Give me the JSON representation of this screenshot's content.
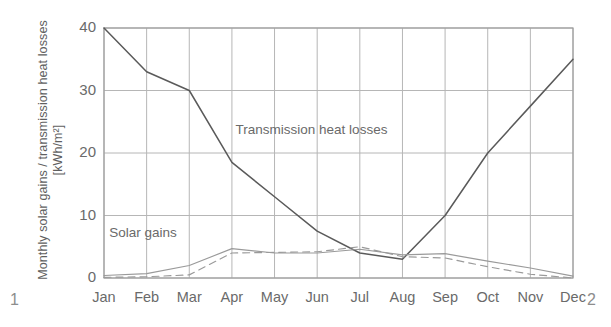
{
  "figure": {
    "corner_label_left": "1",
    "corner_label_right": "2"
  },
  "chart_data": {
    "type": "line",
    "title": "",
    "xlabel": "",
    "ylabel": "Monthly solar gains / transmission heat losses [kWh/m²]",
    "categories": [
      "Jan",
      "Feb",
      "Mar",
      "Apr",
      "May",
      "Jun",
      "Jul",
      "Aug",
      "Sep",
      "Oct",
      "Nov",
      "Dec"
    ],
    "ylim": [
      0,
      40
    ],
    "yticks": [
      0,
      10,
      20,
      30,
      40
    ],
    "ytick_labels": [
      "0",
      "10",
      "20",
      "30",
      "40"
    ],
    "grid": true,
    "legend": "inline-annotations",
    "annotations": [
      {
        "text": "Transmission heat losses",
        "x_month": "Jun",
        "y_value": 23.5
      },
      {
        "text": "Solar gains",
        "x_month": "Feb",
        "y_value": 7.0
      }
    ],
    "series": [
      {
        "name": "Transmission heat losses",
        "style": "solid",
        "color": "#5a5a5a",
        "values": [
          40.0,
          33.0,
          30.0,
          18.5,
          13.0,
          7.5,
          4.0,
          3.0,
          10.0,
          20.0,
          27.5,
          35.0
        ]
      },
      {
        "name": "Solar gains (solid)",
        "style": "solid",
        "color": "#9a9a9a",
        "values": [
          0.4,
          0.7,
          2.0,
          4.7,
          4.0,
          4.0,
          4.6,
          3.7,
          3.9,
          2.7,
          1.6,
          0.3
        ]
      },
      {
        "name": "Solar gains (dashed)",
        "style": "dashed",
        "color": "#9a9a9a",
        "values": [
          0.1,
          0.2,
          0.5,
          4.0,
          4.1,
          4.2,
          5.0,
          3.4,
          3.2,
          1.8,
          0.6,
          0.0
        ]
      }
    ]
  }
}
